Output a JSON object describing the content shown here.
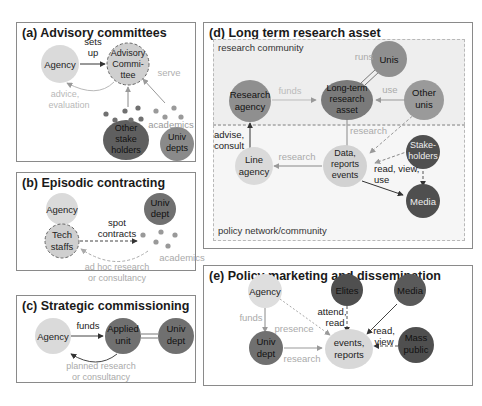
{
  "colors": {
    "light_node": "#d9d9d9",
    "mid_node": "#8f8f8f",
    "dark_node": "#5f5f5f",
    "darker_node": "#4a4a4a",
    "faint_label": "#b0b0b0",
    "dark_label": "#222222",
    "zone_bg": "#efefef",
    "zone_bg2": "#f7f7f7"
  },
  "panels": {
    "a": {
      "title": "(a) Advisory committees",
      "nodes": {
        "agency": "Agency",
        "committee": [
          "Advisory",
          "Commi-",
          "ttee"
        ],
        "stakeholders": [
          "Other",
          "stake",
          "holders"
        ],
        "univ_depts": [
          "Univ",
          "depts"
        ]
      },
      "labels": {
        "sets_up": [
          "sets",
          "up"
        ],
        "serve": "serve",
        "advice": [
          "advice,",
          "evaluation"
        ],
        "academics": "academics"
      }
    },
    "b": {
      "title": "(b) Episodic contracting",
      "nodes": {
        "agency": "Agency",
        "tech_staffs": [
          "Tech",
          "staffs"
        ],
        "univ_dept": [
          "Univ",
          "dept"
        ]
      },
      "labels": {
        "spot_contracts": [
          "spot",
          "contracts"
        ],
        "academics": "academics",
        "adhoc": [
          "ad hoc research",
          "or consultancy"
        ]
      }
    },
    "c": {
      "title": "(c) Strategic commissioning",
      "nodes": {
        "agency": "Agency",
        "applied_unit": [
          "Applied",
          "unit"
        ],
        "univ_dept": [
          "Univ",
          "dept"
        ]
      },
      "labels": {
        "funds": "funds",
        "planned": [
          "planned research",
          "or consultancy"
        ]
      }
    },
    "d": {
      "title": "(d) Long term research asset",
      "zones": {
        "research_community": "research community",
        "policy_network": "policy network/community"
      },
      "nodes": {
        "research_agency": [
          "Research",
          "agency"
        ],
        "asset": [
          "Long-term",
          "research",
          "asset"
        ],
        "unis": "Unis",
        "other_unis": [
          "Other",
          "unis"
        ],
        "line_agency": [
          "Line",
          "agency"
        ],
        "data": [
          "Data,",
          "reports",
          "events"
        ],
        "stakeholders": [
          "Stake-",
          "holders"
        ],
        "media": "Media"
      },
      "labels": {
        "funds": "funds",
        "runs": "runs",
        "use": "use",
        "advise": [
          "advise,",
          "consult"
        ],
        "research_down": "research",
        "research_left": "research",
        "read_view_use": [
          "read, view,",
          "use"
        ]
      }
    },
    "e": {
      "title": "(e) Policy marketing and dissemination",
      "nodes": {
        "agency": "Agency",
        "elites": "Elites",
        "media": "Media",
        "univ_dept": [
          "Univ",
          "dept"
        ],
        "events": [
          "events,",
          "reports"
        ],
        "mass_public": [
          "Mass",
          "public"
        ]
      },
      "labels": {
        "funds": "funds",
        "presence": "presence",
        "attend_read": [
          "attend,",
          "read"
        ],
        "research": "research",
        "read_view": [
          "read,",
          "view"
        ]
      }
    }
  }
}
